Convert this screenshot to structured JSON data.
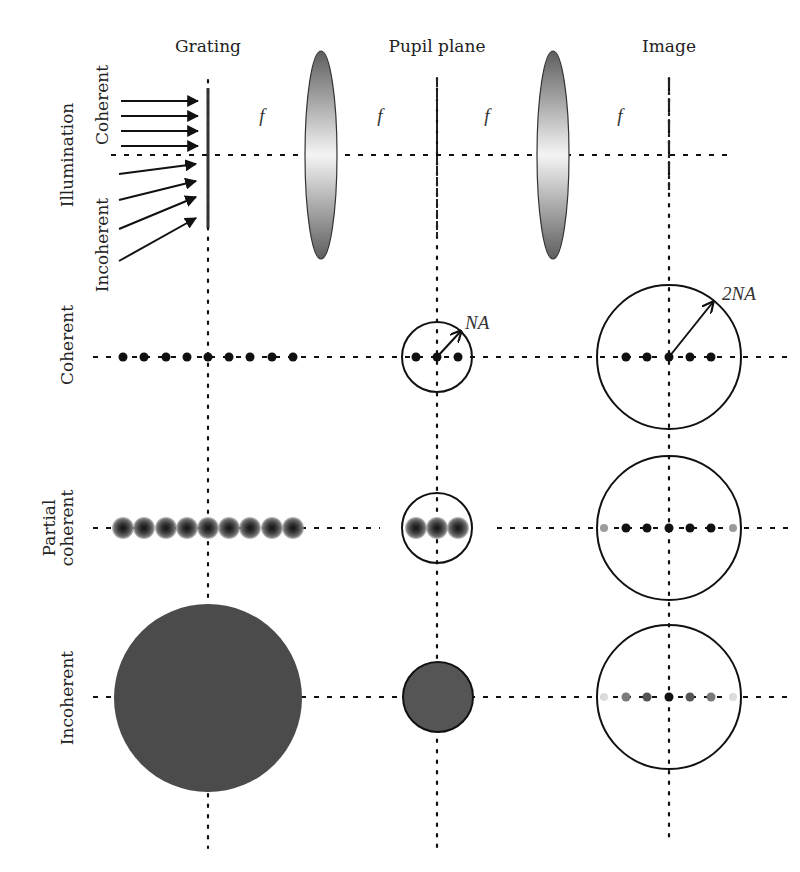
{
  "columns": {
    "grating": {
      "label": "Grating",
      "x": 208
    },
    "pupil": {
      "label": "Pupil plane",
      "x": 437
    },
    "image": {
      "label": "Image",
      "x": 669
    }
  },
  "focal_labels": [
    {
      "text": "f",
      "x": 262
    },
    {
      "text": "f",
      "x": 380
    },
    {
      "text": "f",
      "x": 487
    },
    {
      "text": "f",
      "x": 620
    }
  ],
  "rows": {
    "illumination": {
      "label": "Illumination",
      "sub_top": "Coherent",
      "sub_bottom": "Incoherent",
      "y": 155
    },
    "coherent": {
      "label": "Coherent",
      "y": 357
    },
    "partial": {
      "label_line1": "Partial",
      "label_line2": "coherent",
      "y": 528
    },
    "incoherent": {
      "label": "Incoherent",
      "y": 697
    }
  },
  "annotations": {
    "pupil_radius": "NA",
    "image_radius": "2NA"
  },
  "colors": {
    "ink": "#111111",
    "disc_fill": "#4b4b4b",
    "pupil_disc_fill": "#555555",
    "lens_edge": "#6a6a6a",
    "lens_center": "#f2f2f2"
  },
  "diagram": {
    "coherent_grating_orders": 9,
    "coherent_pupil_orders": 3,
    "coherent_image_orders": 5,
    "partial_grating_orders": 9,
    "partial_pupil_orders": 3,
    "partial_image_orders": 7,
    "incoherent_image_orders": 7
  }
}
